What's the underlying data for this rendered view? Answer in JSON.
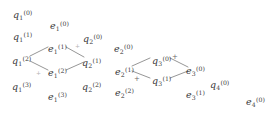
{
  "figure": {
    "kind": "lattice-diagram",
    "ink_color": "#3a3a3a",
    "edge_color": "#8a8a8a",
    "plus_color": "#6a6a6a",
    "background": "#ffffff",
    "width": 275,
    "height": 132
  },
  "nodes": [
    {
      "id": "q1_0",
      "base": "q",
      "sub": "1",
      "sup": "(0)",
      "x": 13,
      "y": 10
    },
    {
      "id": "e1_0",
      "base": "e",
      "sub": "1",
      "sup": "(0)",
      "x": 50,
      "y": 21
    },
    {
      "id": "q1_1",
      "base": "q",
      "sub": "1",
      "sup": "(1)",
      "x": 13,
      "y": 32
    },
    {
      "id": "q2_0",
      "base": "q",
      "sub": "2",
      "sup": "(0)",
      "x": 83,
      "y": 34
    },
    {
      "id": "e1_1",
      "base": "e",
      "sub": "1",
      "sup": "(1)",
      "x": 48,
      "y": 44
    },
    {
      "id": "e2_0",
      "base": "e",
      "sub": "2",
      "sup": "(0)",
      "x": 114,
      "y": 44
    },
    {
      "id": "q1_2",
      "base": "q",
      "sub": "1",
      "sup": "(2)",
      "x": 12,
      "y": 56
    },
    {
      "id": "q2_1",
      "base": "q",
      "sub": "2",
      "sup": "(1)",
      "x": 82,
      "y": 58
    },
    {
      "id": "q3_0",
      "base": "q",
      "sub": "3",
      "sup": "(0)",
      "x": 152,
      "y": 56
    },
    {
      "id": "e1_2",
      "base": "e",
      "sub": "1",
      "sup": "(2)",
      "x": 48,
      "y": 68
    },
    {
      "id": "e2_1",
      "base": "e",
      "sub": "2",
      "sup": "(1)",
      "x": 115,
      "y": 67
    },
    {
      "id": "e3_0",
      "base": "e",
      "sub": "3",
      "sup": "(0)",
      "x": 186,
      "y": 66
    },
    {
      "id": "q3_1",
      "base": "q",
      "sub": "3",
      "sup": "(1)",
      "x": 152,
      "y": 76
    },
    {
      "id": "q1_3",
      "base": "q",
      "sub": "1",
      "sup": "(3)",
      "x": 12,
      "y": 82
    },
    {
      "id": "q2_2",
      "base": "q",
      "sub": "2",
      "sup": "(2)",
      "x": 82,
      "y": 82
    },
    {
      "id": "q4_0",
      "base": "q",
      "sub": "4",
      "sup": "(0)",
      "x": 210,
      "y": 80
    },
    {
      "id": "e1_3",
      "base": "e",
      "sub": "1",
      "sup": "(3)",
      "x": 48,
      "y": 92
    },
    {
      "id": "e2_2",
      "base": "e",
      "sub": "2",
      "sup": "(2)",
      "x": 115,
      "y": 88
    },
    {
      "id": "e3_1",
      "base": "e",
      "sub": "3",
      "sup": "(1)",
      "x": 186,
      "y": 90
    },
    {
      "id": "e4_0",
      "base": "e",
      "sub": "4",
      "sup": "(0)",
      "x": 246,
      "y": 97
    }
  ],
  "edges": [
    {
      "id": "edge-q1_2-e1_1",
      "x1": 30,
      "y1": 56,
      "x2": 48,
      "y2": 47
    },
    {
      "id": "edge-e1_1-q2_1",
      "x1": 66,
      "y1": 47,
      "x2": 84,
      "y2": 57
    },
    {
      "id": "edge-q1_2-e1_2",
      "x1": 30,
      "y1": 61,
      "x2": 48,
      "y2": 70
    },
    {
      "id": "edge-e1_2-q2_1",
      "x1": 66,
      "y1": 70,
      "x2": 84,
      "y2": 62
    },
    {
      "id": "edge-e2_1-q3_0",
      "x1": 132,
      "y1": 66,
      "x2": 150,
      "y2": 58
    },
    {
      "id": "edge-q3_0-e3_0",
      "x1": 170,
      "y1": 58,
      "x2": 188,
      "y2": 67
    },
    {
      "id": "edge-e2_1-q3_1",
      "x1": 132,
      "y1": 71,
      "x2": 150,
      "y2": 78
    },
    {
      "id": "edge-q3_1-e3_0",
      "x1": 170,
      "y1": 78,
      "x2": 188,
      "y2": 71
    }
  ],
  "markers": [
    {
      "id": "marker-upper-left-diamond",
      "symbol": "+",
      "x": 75,
      "y": 43,
      "faint": true
    },
    {
      "id": "marker-lower-left-diamond",
      "symbol": "+",
      "x": 36,
      "y": 70,
      "faint": true
    },
    {
      "id": "marker-upper-right-diamond",
      "symbol": "+",
      "x": 172,
      "y": 54,
      "faint": false
    },
    {
      "id": "marker-lower-right-diamond",
      "symbol": "+",
      "x": 134,
      "y": 76,
      "faint": false
    }
  ]
}
